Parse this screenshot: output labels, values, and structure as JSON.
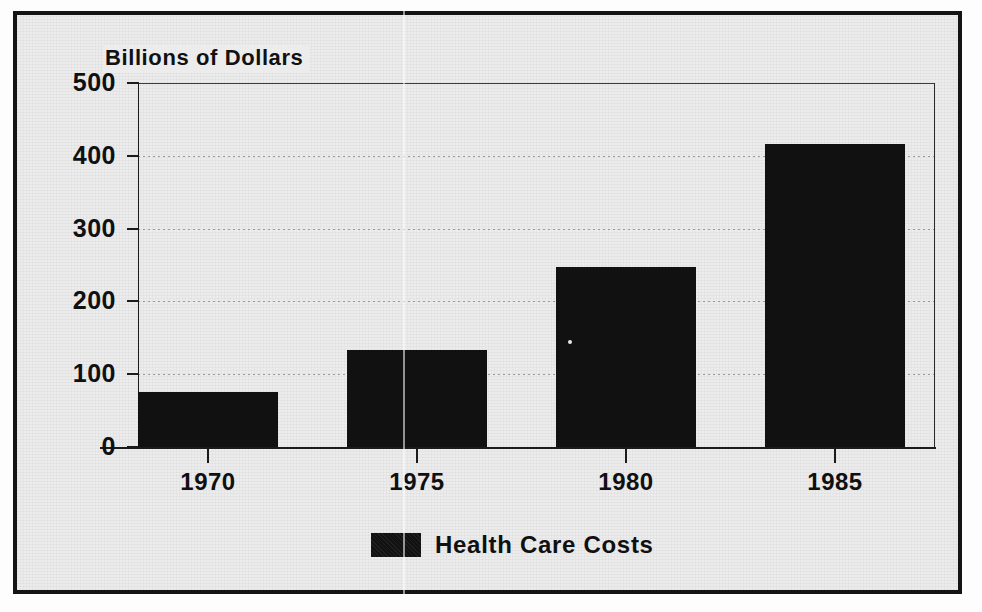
{
  "chart_data": {
    "type": "bar",
    "title": "",
    "axis_title": "Billions of Dollars",
    "xlabel": "",
    "ylabel": "Billions of Dollars",
    "categories": [
      "1970",
      "1975",
      "1980",
      "1985"
    ],
    "values": [
      75,
      133,
      247,
      416
    ],
    "series": [
      {
        "name": "Health Care Costs",
        "values": [
          75,
          133,
          247,
          416
        ],
        "color": "#111111"
      }
    ],
    "ylim": [
      0,
      500
    ],
    "ytick_labels": [
      "500",
      "400",
      "300",
      "200",
      "100",
      "0"
    ],
    "ytick_values": [
      500,
      400,
      300,
      200,
      100,
      0
    ],
    "grid": true,
    "grid_orientation": "horizontal",
    "legend": {
      "position": "bottom-center",
      "entries": [
        {
          "label": "Health Care Costs",
          "color": "#111111"
        }
      ]
    },
    "bar_color": "#111111",
    "background_color": "#ececed",
    "frame_color": "#141414"
  },
  "figure": {
    "axis_title": "Billions of Dollars",
    "legend_label": "Health Care Costs"
  },
  "y_axis": {
    "ticks": [
      {
        "label": "500",
        "value": 500
      },
      {
        "label": "400",
        "value": 400
      },
      {
        "label": "300",
        "value": 300
      },
      {
        "label": "200",
        "value": 200
      },
      {
        "label": "100",
        "value": 100
      },
      {
        "label": "0",
        "value": 0
      }
    ]
  },
  "x_axis": {
    "ticks": [
      {
        "label": "1970"
      },
      {
        "label": "1975"
      },
      {
        "label": "1980"
      },
      {
        "label": "1985"
      }
    ]
  },
  "bars": [
    {
      "category": "1970",
      "value": 75
    },
    {
      "category": "1975",
      "value": 133
    },
    {
      "category": "1980",
      "value": 247
    },
    {
      "category": "1985",
      "value": 416
    }
  ]
}
